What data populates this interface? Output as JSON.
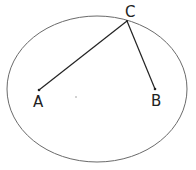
{
  "diagram": {
    "type": "geometry",
    "circle": {
      "cx": 97,
      "cy": 89,
      "rx": 90,
      "ry": 73,
      "stroke": "#666666"
    },
    "center_dot": {
      "x": 76,
      "y": 97
    },
    "points": [
      {
        "id": "A",
        "label": "A",
        "x": 39,
        "y": 90,
        "label_x": 33,
        "label_y": 106
      },
      {
        "id": "B",
        "label": "B",
        "x": 155,
        "y": 89,
        "label_x": 151,
        "label_y": 105
      },
      {
        "id": "C",
        "label": "C",
        "x": 127,
        "y": 21,
        "label_x": 125,
        "label_y": 17
      }
    ],
    "segments": [
      {
        "from": "C",
        "to": "A"
      },
      {
        "from": "C",
        "to": "B"
      }
    ],
    "line_color": "#222222"
  }
}
